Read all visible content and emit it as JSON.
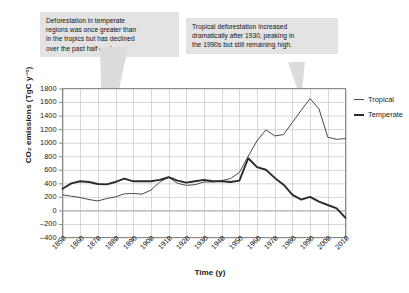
{
  "figure": {
    "background_color": "#ffffff",
    "callouts": [
      {
        "name": "temperate-callout",
        "lines": [
          "Deforestation in temperate",
          "regions was once greater than",
          "in the tropics but has declined",
          "over the past half century."
        ],
        "background_color": "#e3e3e3"
      },
      {
        "name": "tropical-callout",
        "lines": [
          "Tropical deforestation increased",
          "dramatically after 1930, peaking in",
          "the 1990s but still remaining high."
        ],
        "background_color": "#e3e3e3"
      }
    ]
  },
  "chart_data": {
    "type": "line",
    "title": "",
    "xlabel": "Time (y)",
    "ylabel": "CO₂ emissions (TgC y⁻¹)",
    "xlim": [
      1850,
      2010
    ],
    "ylim": [
      -400,
      1800
    ],
    "yticks": [
      1800,
      1600,
      1400,
      1200,
      1000,
      800,
      600,
      400,
      200,
      0,
      -200,
      -400
    ],
    "xticks": [
      1850,
      1860,
      1870,
      1880,
      1890,
      1900,
      1910,
      1920,
      1930,
      1940,
      1950,
      1960,
      1970,
      1980,
      1990,
      2000,
      2010
    ],
    "grid": true,
    "grid_color": "#bdbdbd",
    "legend_position": "right",
    "x": [
      1850,
      1855,
      1860,
      1865,
      1870,
      1875,
      1880,
      1885,
      1890,
      1895,
      1900,
      1905,
      1910,
      1915,
      1920,
      1925,
      1930,
      1935,
      1940,
      1945,
      1950,
      1955,
      1960,
      1965,
      1970,
      1975,
      1980,
      1985,
      1990,
      1995,
      2000,
      2005,
      2010
    ],
    "series": [
      {
        "name": "Tropical",
        "color": "#4a4a4a",
        "line_width": 1.0,
        "values": [
          230,
          210,
          190,
          160,
          140,
          175,
          200,
          245,
          250,
          240,
          300,
          420,
          490,
          400,
          370,
          380,
          420,
          420,
          440,
          470,
          560,
          800,
          1030,
          1190,
          1100,
          1120,
          1300,
          1480,
          1650,
          1500,
          1080,
          1050,
          1060
        ]
      },
      {
        "name": "Temperate",
        "color": "#2b2b2b",
        "line_width": 1.9,
        "values": [
          320,
          400,
          430,
          420,
          390,
          385,
          420,
          470,
          430,
          430,
          430,
          450,
          490,
          440,
          410,
          430,
          450,
          430,
          430,
          420,
          440,
          770,
          640,
          600,
          480,
          380,
          230,
          160,
          200,
          130,
          80,
          30,
          -110
        ]
      }
    ],
    "annotations": [
      {
        "name": "temperate-pointer",
        "target_x": 1882,
        "target_y": 620
      },
      {
        "name": "tropical-pointer",
        "target_x": 1990,
        "target_y": 1660
      }
    ]
  },
  "legend": {
    "items": [
      {
        "label": "Tropical",
        "color": "#4a4a4a"
      },
      {
        "label": "Temperate",
        "color": "#2b2b2b"
      }
    ]
  }
}
